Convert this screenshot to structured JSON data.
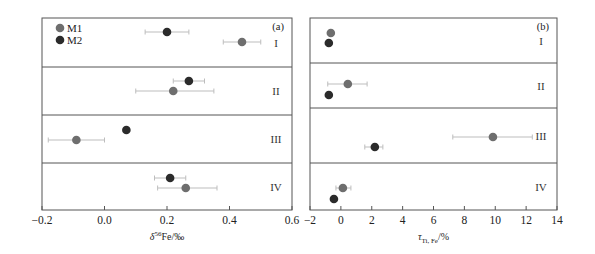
{
  "chart_data": [
    {
      "type": "scatter",
      "panel_label": "(a)",
      "xlabel": "δ56Fe/‰",
      "xlabel_parts": {
        "delta": "δ",
        "sup": "56",
        "rest": "Fe/‰"
      },
      "xlim": [
        -0.2,
        0.6
      ],
      "xticks": [
        -0.2,
        0.0,
        0.2,
        0.4,
        0.6
      ],
      "xtick_labels": [
        "−0.2",
        "0.0",
        "0.2",
        "0.4",
        "0.6"
      ],
      "groups": [
        "I",
        "II",
        "III",
        "IV"
      ],
      "legend": [
        {
          "name": "M1",
          "color": "#6e6e6e"
        },
        {
          "name": "M2",
          "color": "#2b2b2b"
        }
      ],
      "series": [
        {
          "name": "M1",
          "color": "#6e6e6e",
          "values": [
            0.44,
            0.22,
            -0.09,
            0.26
          ],
          "err_low": [
            0.38,
            0.1,
            -0.18,
            0.17
          ],
          "err_high": [
            0.5,
            0.35,
            0.0,
            0.36
          ]
        },
        {
          "name": "M2",
          "color": "#2b2b2b",
          "values": [
            0.2,
            0.27,
            0.07,
            0.21
          ],
          "err_low": [
            0.13,
            0.22,
            0.06,
            0.16
          ],
          "err_high": [
            0.27,
            0.32,
            0.08,
            0.26
          ]
        }
      ],
      "grid": false,
      "legend_position": "upper left"
    },
    {
      "type": "scatter",
      "panel_label": "(b)",
      "xlabel": "τTi, Fe/%",
      "xlabel_parts": {
        "tau": "τ",
        "sub": "Ti, Fe",
        "rest": "/%"
      },
      "xlim": [
        -2,
        14
      ],
      "xticks": [
        -2,
        0,
        2,
        4,
        6,
        8,
        10,
        12,
        14
      ],
      "xtick_labels": [
        "−2",
        "0",
        "2",
        "4",
        "6",
        "8",
        "10",
        "12",
        "14"
      ],
      "groups": [
        "I",
        "II",
        "III",
        "IV"
      ],
      "series": [
        {
          "name": "M1",
          "color": "#6e6e6e",
          "values": [
            -0.65,
            0.45,
            9.85,
            0.13
          ],
          "err_low": [
            -0.65,
            -0.85,
            7.25,
            -0.32
          ],
          "err_high": [
            -0.65,
            1.7,
            12.4,
            0.65
          ]
        },
        {
          "name": "M2",
          "color": "#2b2b2b",
          "values": [
            -0.78,
            -0.78,
            2.2,
            -0.45
          ],
          "err_low": [
            -0.78,
            -0.78,
            1.55,
            -0.45
          ],
          "err_high": [
            -0.78,
            -0.78,
            2.72,
            -0.45
          ]
        }
      ],
      "grid": false
    }
  ]
}
